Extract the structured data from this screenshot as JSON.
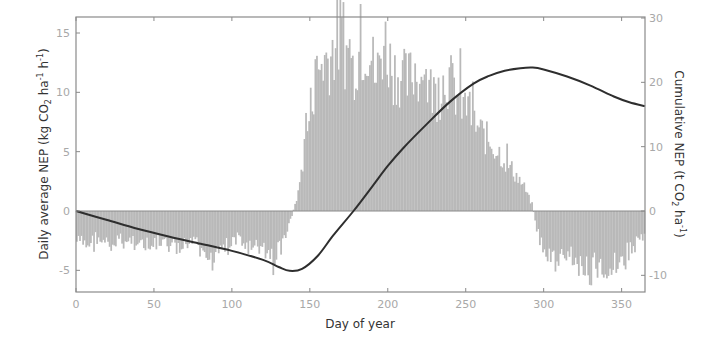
{
  "chart_data": {
    "type": "bar+line",
    "title": "",
    "xlabel": "Day of year",
    "ylabel_left": "Daily average NEP (kg CO2 ha-1 h-1)",
    "ylabel_left_parts": {
      "pre": "Daily average NEP (kg CO",
      "sub": "2",
      "mid": " ha",
      "sup1": "-1",
      "mid2": " h",
      "sup2": "-1",
      "post": ")"
    },
    "ylabel_right": "Cumulative NEP (t CO2 ha-1)",
    "ylabel_right_parts": {
      "pre": "Cumulative NEP (t CO",
      "sub": "2",
      "mid": " ha",
      "sup1": "-1",
      "post": ")"
    },
    "xlim": [
      0,
      365
    ],
    "ylim_left": [
      -6.8,
      16.5
    ],
    "ylim_right": [
      -11.5,
      30
    ],
    "xticks": [
      0,
      50,
      100,
      150,
      200,
      250,
      300,
      350
    ],
    "yticks_left": [
      -5,
      0,
      5,
      10,
      15
    ],
    "yticks_right": [
      -10,
      0,
      10,
      20,
      30
    ],
    "grid": false,
    "legend": null,
    "colors": {
      "bars": "#b9b9b9",
      "curve": "#2e2e2e",
      "axis": "#8a8a8a",
      "zero_line": "#9a9a9a"
    },
    "series": [
      {
        "name": "Daily average NEP",
        "type": "bar",
        "axis": "left",
        "x_step_days": 5,
        "x": [
          2,
          7,
          12,
          17,
          22,
          27,
          32,
          37,
          42,
          47,
          52,
          57,
          62,
          67,
          72,
          77,
          82,
          87,
          92,
          97,
          102,
          107,
          112,
          117,
          122,
          127,
          132,
          137,
          142,
          147,
          152,
          157,
          162,
          167,
          172,
          177,
          182,
          187,
          192,
          197,
          202,
          207,
          212,
          217,
          222,
          227,
          232,
          237,
          242,
          247,
          252,
          257,
          262,
          267,
          272,
          277,
          282,
          287,
          292,
          297,
          302,
          307,
          312,
          317,
          322,
          327,
          332,
          337,
          342,
          347,
          352,
          357,
          362
        ],
        "values": [
          -2.6,
          -2.9,
          -2.2,
          -2.5,
          -3.0,
          -2.4,
          -2.7,
          -2.3,
          -2.8,
          -3.1,
          -2.6,
          -2.9,
          -3.0,
          -3.4,
          -2.5,
          -2.9,
          -3.2,
          -3.6,
          -2.7,
          -3.0,
          -2.3,
          -2.6,
          -3.3,
          -3.0,
          -3.5,
          -3.8,
          -2.6,
          -0.8,
          1.5,
          6.0,
          10.5,
          12.5,
          13.0,
          14.5,
          13.5,
          12.0,
          13.8,
          14.2,
          11.0,
          14.5,
          12.0,
          11.5,
          10.8,
          12.0,
          11.0,
          10.2,
          9.8,
          11.5,
          10.2,
          9.0,
          8.2,
          7.0,
          6.2,
          5.5,
          4.8,
          3.8,
          3.0,
          2.0,
          0.5,
          -2.5,
          -3.8,
          -4.2,
          -3.9,
          -3.5,
          -4.5,
          -4.8,
          -4.6,
          -5.0,
          -4.7,
          -4.2,
          -3.6,
          -3.0,
          -2.2
        ]
      },
      {
        "name": "Cumulative NEP",
        "type": "line",
        "axis": "right",
        "x": [
          0,
          20,
          40,
          60,
          80,
          100,
          120,
          130,
          137,
          145,
          155,
          165,
          178,
          190,
          200,
          210,
          225,
          240,
          255,
          265,
          275,
          285,
          293,
          300,
          315,
          330,
          345,
          355,
          365
        ],
        "values": [
          0,
          -1.4,
          -2.8,
          -4.0,
          -5.1,
          -6.2,
          -7.6,
          -8.7,
          -9.3,
          -9.0,
          -7.0,
          -3.8,
          0,
          3.8,
          7.0,
          9.8,
          13.5,
          17.0,
          19.8,
          21.0,
          21.8,
          22.2,
          22.3,
          22.0,
          20.9,
          19.5,
          17.8,
          16.9,
          16.3
        ]
      }
    ]
  }
}
